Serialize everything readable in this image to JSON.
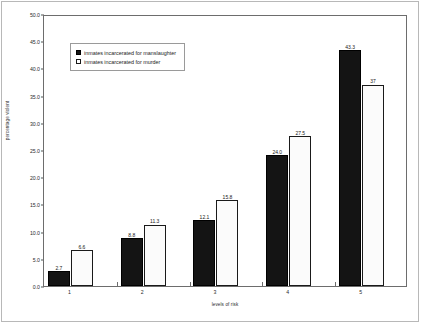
{
  "chart_data": {
    "type": "bar",
    "title": "",
    "subtitle": "",
    "xlabel": "levels of risk",
    "ylabel": "percentage violent",
    "categories": [
      "1",
      "2",
      "3",
      "4",
      "5"
    ],
    "series": [
      {
        "name": "inmates incarcerated for manslaughter",
        "values": [
          2.7,
          8.8,
          12.1,
          24.0,
          43.3
        ],
        "labels": [
          "2.7",
          "8.8",
          "12.1",
          "24.0",
          "43.3"
        ],
        "fill": "#141414",
        "style": "solid-black"
      },
      {
        "name": "inmates incarcerated for murder",
        "values": [
          6.6,
          11.3,
          15.8,
          27.5,
          37.0
        ],
        "labels": [
          "6.6",
          "11.3",
          "15.8",
          "27.5",
          "37"
        ],
        "fill": "#fbfbfb",
        "style": "white-dotted"
      }
    ],
    "ylim": [
      0,
      50
    ],
    "yticks": [
      0,
      5,
      10,
      15,
      20,
      25,
      30,
      35,
      40,
      45,
      50
    ],
    "ytick_labels": [
      "0.0",
      "5.0",
      "10.0",
      "15.0",
      "20.0",
      "25.0",
      "30.0",
      "35.0",
      "40.0",
      "45.0",
      "50.0"
    ],
    "grid": false,
    "legend_position": "upper-left-inside",
    "show_data_labels": true
  },
  "legend": {
    "entries": [
      {
        "label": "inmates incarcerated for manslaughter"
      },
      {
        "label": "inmates incarcerated for murder"
      }
    ]
  },
  "axes": {
    "y_title": "percentage violent",
    "x_title": "levels of risk"
  }
}
